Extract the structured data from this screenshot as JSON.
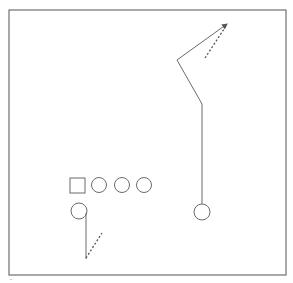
{
  "diagram": {
    "type": "football-play",
    "colors": {
      "stroke": "#6b6b6b",
      "frame": "#707070",
      "background": "#ffffff"
    },
    "frame": {
      "x": 9,
      "y": 10,
      "w": 277,
      "h": 265
    },
    "players": [
      {
        "id": "center",
        "shape": "square",
        "x": 70,
        "y": 178,
        "size": 15
      },
      {
        "id": "lineman-1",
        "shape": "circle",
        "cx": 99,
        "cy": 185,
        "r": 7.5
      },
      {
        "id": "lineman-2",
        "shape": "circle",
        "cx": 122,
        "cy": 185,
        "r": 7.5
      },
      {
        "id": "lineman-3",
        "shape": "circle",
        "cx": 144,
        "cy": 185,
        "r": 7.5
      },
      {
        "id": "back",
        "shape": "circle",
        "cx": 79,
        "cy": 211,
        "r": 8
      },
      {
        "id": "receiver",
        "shape": "circle",
        "cx": 202,
        "cy": 212,
        "r": 8
      }
    ],
    "routes": [
      {
        "id": "receiver-route",
        "style": "solid",
        "points": [
          [
            202,
            204
          ],
          [
            202,
            104
          ],
          [
            177,
            60
          ],
          [
            227,
            24
          ]
        ],
        "arrow": true
      },
      {
        "id": "receiver-option",
        "style": "dashed",
        "points": [
          [
            205,
            58
          ],
          [
            227,
            24
          ]
        ]
      },
      {
        "id": "back-route",
        "style": "solid",
        "points": [
          [
            86,
            213
          ],
          [
            86,
            259
          ]
        ]
      },
      {
        "id": "back-option",
        "style": "dashed",
        "points": [
          [
            86,
            258
          ],
          [
            102,
            233
          ]
        ]
      }
    ],
    "caption": "-"
  }
}
